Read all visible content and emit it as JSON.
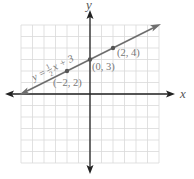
{
  "chart_data": {
    "type": "line",
    "title": "",
    "xlabel": "x",
    "ylabel": "y",
    "xlim": [
      -6,
      6
    ],
    "ylim": [
      -6,
      6
    ],
    "grid": true,
    "grid_step": 1,
    "legend": null,
    "series": [
      {
        "name": "y = 1/2 x + 3",
        "equation": "y = ½x + 3",
        "slope": 0.5,
        "intercept": 3,
        "x": [
          -6,
          6
        ],
        "y": [
          0,
          6
        ],
        "arrows": "both"
      }
    ],
    "points": [
      {
        "x": -2,
        "y": 2,
        "label": "(−2, 2)"
      },
      {
        "x": 0,
        "y": 3,
        "label": "(0, 3)"
      },
      {
        "x": 2,
        "y": 4,
        "label": "(2, 4)"
      }
    ],
    "annotations": [
      {
        "text": "y = ½x + 3",
        "position": "along line, left of (-2, 2)"
      }
    ]
  },
  "labels": {
    "x_axis": "x",
    "y_axis": "y",
    "equation_prefix": "y = ",
    "equation_num": "1",
    "equation_den": "2",
    "equation_suffix": "x + 3",
    "point_a": "(−2, 2)",
    "point_b": "(0, 3)",
    "point_c": "(2, 4)"
  },
  "colors": {
    "grid": "#d9d9d9",
    "axis": "#222222",
    "line": "#6e6e6e",
    "point": "#555555",
    "label": "#777777"
  }
}
